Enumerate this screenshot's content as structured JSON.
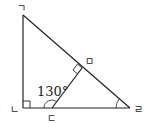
{
  "diagram": {
    "type": "geometry",
    "vertices": {
      "g": {
        "label": "ㄱ",
        "x": 23,
        "y": 15
      },
      "n": {
        "label": "ㄴ",
        "x": 23,
        "y": 108
      },
      "d": {
        "label": "ㄷ",
        "x": 52,
        "y": 108
      },
      "r": {
        "label": "ㄹ",
        "x": 130,
        "y": 108
      },
      "m": {
        "label": "ㅁ",
        "x": 82,
        "y": 68
      }
    },
    "angle_label": "130°",
    "right_angles": [
      "ㄴ",
      "ㅁ"
    ],
    "marked_angles": [
      "∠ㄱㄷㄴ... exterior at ㄷ = 130°",
      "∠ㄹ"
    ],
    "line_color": "#222222"
  }
}
